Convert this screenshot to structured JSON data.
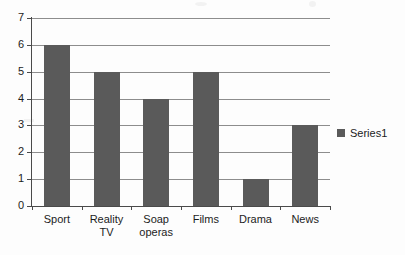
{
  "chart_data": {
    "type": "bar",
    "title": "",
    "subtitle": "",
    "xlabel": "",
    "ylabel": "",
    "categories": [
      "Sport",
      "Reality TV",
      "Soap operas",
      "Films",
      "Drama",
      "News"
    ],
    "category_lines": [
      [
        "Sport"
      ],
      [
        "Reality TV"
      ],
      [
        "Soap",
        "operas"
      ],
      [
        "Films"
      ],
      [
        "Drama"
      ],
      [
        "News"
      ]
    ],
    "values": [
      6,
      5,
      4,
      5,
      1,
      3
    ],
    "series": [
      {
        "name": "Series1",
        "values": [
          6,
          5,
          4,
          5,
          1,
          3
        ]
      }
    ],
    "ylim": [
      0,
      7
    ],
    "ytick_labels": [
      "0",
      "1",
      "2",
      "3",
      "4",
      "5",
      "6",
      "7"
    ],
    "ytick_values": [
      0,
      1,
      2,
      3,
      4,
      5,
      6,
      7
    ],
    "grid": true,
    "grid_axis": "y",
    "legend": {
      "position": "right",
      "entries": [
        {
          "label": "Series1",
          "color": "#5a5a5a"
        }
      ]
    },
    "colors": {
      "bar": "#5a5a5a",
      "gridline": "#8d8d8d",
      "axis": "#4a4a4a",
      "text": "#1c1c1c",
      "background": "#fdfdfd"
    }
  }
}
